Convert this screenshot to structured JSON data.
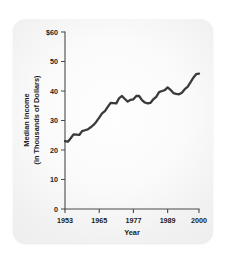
{
  "chart_data": {
    "type": "line",
    "title": "",
    "xlabel": "Year",
    "ylabel_line1": "Median Income",
    "ylabel_line2": "(in Thousands of Dollars)",
    "ylabel": "Median Income (in Thousands of Dollars)",
    "xlim": [
      1953,
      2000
    ],
    "ylim": [
      0,
      60
    ],
    "grid": false,
    "legend": false,
    "line_color": "#3a3a3a",
    "panel_color": "#eeeeee",
    "x_tick_labels": [
      "1953",
      "1965",
      "1977",
      "1989",
      "2000"
    ],
    "x_tick_values": [
      1953,
      1965,
      1977,
      1989,
      2000
    ],
    "y_tick_labels": [
      "0",
      "10",
      "20",
      "30",
      "40",
      "50",
      "$60"
    ],
    "y_tick_values": [
      0,
      10,
      20,
      30,
      40,
      50,
      60
    ],
    "x": [
      1953,
      1954,
      1955,
      1956,
      1957,
      1958,
      1959,
      1960,
      1961,
      1962,
      1963,
      1964,
      1965,
      1966,
      1967,
      1968,
      1969,
      1970,
      1971,
      1972,
      1973,
      1974,
      1975,
      1976,
      1977,
      1978,
      1979,
      1980,
      1981,
      1982,
      1983,
      1984,
      1985,
      1986,
      1987,
      1988,
      1989,
      1990,
      1991,
      1992,
      1993,
      1994,
      1995,
      1996,
      1997,
      1998,
      1999,
      2000
    ],
    "values": [
      23.0,
      22.8,
      24.0,
      25.3,
      25.2,
      25.1,
      26.4,
      26.7,
      27.0,
      27.7,
      28.5,
      29.6,
      31.0,
      32.4,
      33.2,
      34.6,
      36.0,
      35.9,
      35.8,
      37.6,
      38.3,
      37.3,
      36.4,
      37.0,
      37.2,
      38.3,
      38.3,
      36.9,
      36.1,
      35.8,
      36.0,
      37.2,
      38.0,
      39.6,
      40.0,
      40.3,
      41.2,
      40.4,
      39.3,
      39.0,
      38.9,
      39.4,
      40.6,
      41.4,
      42.9,
      44.5,
      45.7,
      45.9
    ]
  },
  "figure": {
    "axis_color": "#4a4a4a",
    "text_color": "#1c1c1c"
  }
}
